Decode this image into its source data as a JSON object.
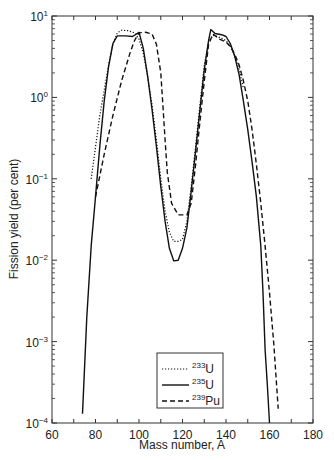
{
  "chart_data": {
    "type": "line",
    "title": "",
    "xlabel": "Mass number, A",
    "ylabel": "Fission yield (per cent)",
    "xlim": [
      60,
      180
    ],
    "ylim": [
      0.0001,
      10
    ],
    "yscale": "log",
    "grid": false,
    "x_ticks": [
      60,
      80,
      100,
      120,
      140,
      160,
      180
    ],
    "x_tick_labels": [
      "60",
      "80",
      "100",
      "120",
      "140",
      "160",
      "180"
    ],
    "y_ticks": [
      {
        "value": 10,
        "base": "10",
        "exp": "1"
      },
      {
        "value": 1,
        "base": "10",
        "exp": "0"
      },
      {
        "value": 0.1,
        "base": "10",
        "exp": "−1"
      },
      {
        "value": 0.01,
        "base": "10",
        "exp": "−2"
      },
      {
        "value": 0.001,
        "base": "10",
        "exp": "−3"
      },
      {
        "value": 0.0001,
        "base": "10",
        "exp": "−4"
      }
    ],
    "legend": {
      "position": "bottom-center",
      "entries": [
        {
          "mass": "233",
          "element": "U",
          "style": "dotted"
        },
        {
          "mass": "235",
          "element": "U",
          "style": "solid"
        },
        {
          "mass": "239",
          "element": "Pu",
          "style": "dashed"
        }
      ]
    },
    "series": [
      {
        "name": "233U",
        "style": "dotted",
        "points": [
          [
            78,
            0.1
          ],
          [
            82,
            0.6
          ],
          [
            86,
            2.5
          ],
          [
            88,
            4.5
          ],
          [
            90,
            6.2
          ],
          [
            92,
            6.7
          ],
          [
            95,
            6.6
          ],
          [
            98,
            6.2
          ],
          [
            100,
            5.2
          ],
          [
            102,
            3.5
          ],
          [
            104,
            1.8
          ],
          [
            106,
            0.8
          ],
          [
            108,
            0.3
          ],
          [
            110,
            0.1
          ],
          [
            112,
            0.04
          ],
          [
            114,
            0.022
          ],
          [
            116,
            0.017
          ],
          [
            118,
            0.017
          ],
          [
            120,
            0.018
          ],
          [
            122,
            0.03
          ],
          [
            124,
            0.08
          ],
          [
            126,
            0.25
          ],
          [
            128,
            0.8
          ],
          [
            130,
            2.5
          ],
          [
            132,
            4.8
          ],
          [
            134,
            5.8
          ],
          [
            136,
            5.6
          ],
          [
            138,
            5.3
          ],
          [
            140,
            5.0
          ],
          [
            142,
            4.3
          ],
          [
            144,
            3.3
          ],
          [
            146,
            2.2
          ],
          [
            148,
            1.3
          ]
        ]
      },
      {
        "name": "235U",
        "style": "solid",
        "points": [
          [
            74,
            0.00013
          ],
          [
            76,
            0.002
          ],
          [
            78,
            0.015
          ],
          [
            80,
            0.06
          ],
          [
            82,
            0.25
          ],
          [
            84,
            0.9
          ],
          [
            86,
            2.4
          ],
          [
            88,
            4.6
          ],
          [
            90,
            5.7
          ],
          [
            94,
            5.7
          ],
          [
            97,
            5.6
          ],
          [
            100,
            6.3
          ],
          [
            102,
            4.0
          ],
          [
            104,
            1.8
          ],
          [
            106,
            0.7
          ],
          [
            108,
            0.25
          ],
          [
            110,
            0.08
          ],
          [
            112,
            0.03
          ],
          [
            114,
            0.014
          ],
          [
            116,
            0.0098
          ],
          [
            118,
            0.01
          ],
          [
            120,
            0.014
          ],
          [
            122,
            0.025
          ],
          [
            124,
            0.07
          ],
          [
            126,
            0.22
          ],
          [
            128,
            0.7
          ],
          [
            130,
            2.2
          ],
          [
            132,
            5.0
          ],
          [
            133,
            6.8
          ],
          [
            135,
            6.1
          ],
          [
            138,
            5.9
          ],
          [
            140,
            5.6
          ],
          [
            142,
            4.6
          ],
          [
            144,
            3.2
          ],
          [
            146,
            1.9
          ],
          [
            148,
            0.9
          ],
          [
            150,
            0.4
          ],
          [
            152,
            0.16
          ],
          [
            154,
            0.06
          ],
          [
            156,
            0.015
          ],
          [
            157,
            0.004
          ],
          [
            158,
            0.0008
          ],
          [
            159,
            0.0003
          ],
          [
            160,
            0.0001
          ]
        ]
      },
      {
        "name": "239Pu",
        "style": "dashed",
        "points": [
          [
            80,
            0.06
          ],
          [
            84,
            0.2
          ],
          [
            88,
            0.6
          ],
          [
            92,
            1.6
          ],
          [
            96,
            3.6
          ],
          [
            98,
            5.0
          ],
          [
            100,
            6.2
          ],
          [
            103,
            6.3
          ],
          [
            106,
            6.0
          ],
          [
            108,
            4.5
          ],
          [
            110,
            2.0
          ],
          [
            111,
            0.8
          ],
          [
            112,
            0.3
          ],
          [
            113,
            0.12
          ],
          [
            115,
            0.05
          ],
          [
            118,
            0.036
          ],
          [
            122,
            0.036
          ],
          [
            124,
            0.05
          ],
          [
            126,
            0.15
          ],
          [
            128,
            0.5
          ],
          [
            130,
            1.6
          ],
          [
            132,
            4.5
          ],
          [
            134,
            6.0
          ],
          [
            137,
            5.2
          ],
          [
            140,
            4.8
          ],
          [
            142,
            4.2
          ],
          [
            144,
            3.4
          ],
          [
            146,
            2.5
          ],
          [
            148,
            1.6
          ],
          [
            150,
            0.9
          ],
          [
            152,
            0.4
          ],
          [
            154,
            0.15
          ],
          [
            156,
            0.05
          ],
          [
            158,
            0.015
          ],
          [
            160,
            0.004
          ],
          [
            162,
            0.0009
          ],
          [
            164,
            0.00015
          ]
        ]
      }
    ]
  }
}
